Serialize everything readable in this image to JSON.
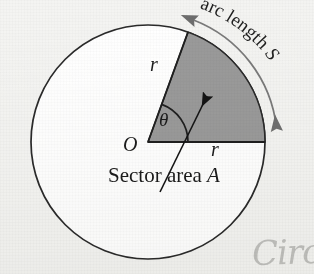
{
  "figure": {
    "type": "geometry-diagram",
    "background_color": "#f4f4f2",
    "stroke_color": "#1f1f1f",
    "sector_fill_color": "#9a9a9a",
    "circle_fill_color": "#ffffff"
  },
  "labels": {
    "center_point": "O",
    "radius_upper": "r",
    "radius_lower": "r",
    "angle": "θ",
    "sector_area_text": "Sector area",
    "sector_area_var": "A",
    "arc_length_text": "arc length ",
    "arc_length_var": "S"
  },
  "annotations": {
    "handwriting": "Circ"
  },
  "geometry": {
    "circle_center_x": 148,
    "circle_center_y": 142,
    "circle_radius": 117,
    "sector_start_angle_deg": 0,
    "sector_end_angle_deg": 70,
    "angle_arc_radius": 40,
    "arc_indicator_radius": 136
  }
}
